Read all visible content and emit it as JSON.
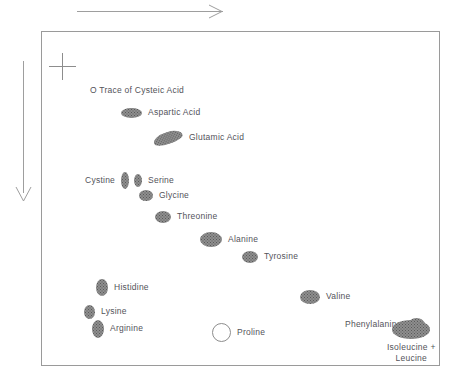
{
  "figure": {
    "background_color": "#ffffff",
    "plate_border_color": "#9a9a9a",
    "spot_color": "#8e8e8e",
    "text_color": "#53535a",
    "arrow_color": "#9e9e9e"
  },
  "arrows": {
    "horizontal": {
      "name": "first-dimension-arrow",
      "direction": "right"
    },
    "vertical": {
      "name": "second-dimension-arrow",
      "direction": "down"
    }
  },
  "origin": {
    "name": "origin-cross-mark",
    "symbol": "+"
  },
  "chart_data": {
    "type": "scatter",
    "xlabel": "",
    "ylabel": "",
    "grid": false,
    "legend": "none",
    "annotations": [
      "O Trace of Cysteic Acid"
    ],
    "spots": [
      {
        "label": "O Trace of Cysteic Acid",
        "name": "spot-cysteic-acid",
        "shape": "trace",
        "x": 90,
        "y": 85,
        "w": 0,
        "h": 0,
        "label_position": "right"
      },
      {
        "label": "Aspartic Acid",
        "name": "spot-aspartic-acid",
        "shape": "ellipse",
        "x": 121,
        "y": 107,
        "w": 21,
        "h": 10,
        "label_position": "right"
      },
      {
        "label": "Glutamic Acid",
        "name": "spot-glutamic-acid",
        "shape": "ellipse-double",
        "x": 153,
        "y": 132,
        "w": 30,
        "h": 12,
        "label_position": "right"
      },
      {
        "label": "Cystine",
        "name": "spot-cystine",
        "shape": "ellipse-vertical",
        "x": 85,
        "y": 172,
        "w": 8,
        "h": 17,
        "label_position": "left"
      },
      {
        "label": "Serine",
        "name": "spot-serine",
        "shape": "ellipse-vertical",
        "x": 134,
        "y": 174,
        "w": 8,
        "h": 13,
        "label_position": "right"
      },
      {
        "label": "Glycine",
        "name": "spot-glycine",
        "shape": "ellipse",
        "x": 139,
        "y": 190,
        "w": 14,
        "h": 11,
        "label_position": "right"
      },
      {
        "label": "Threonine",
        "name": "spot-threonine",
        "shape": "ellipse",
        "x": 155,
        "y": 211,
        "w": 16,
        "h": 12,
        "label_position": "right"
      },
      {
        "label": "Alanine",
        "name": "spot-alanine",
        "shape": "ellipse",
        "x": 200,
        "y": 232,
        "w": 22,
        "h": 15,
        "label_position": "right"
      },
      {
        "label": "Tyrosine",
        "name": "spot-tyrosine",
        "shape": "ellipse",
        "x": 242,
        "y": 251,
        "w": 16,
        "h": 12,
        "label_position": "right"
      },
      {
        "label": "Histidine",
        "name": "spot-histidine",
        "shape": "ellipse-vertical",
        "x": 96,
        "y": 279,
        "w": 12,
        "h": 17,
        "label_position": "right"
      },
      {
        "label": "Lysine",
        "name": "spot-lysine",
        "shape": "ellipse-vertical",
        "x": 84,
        "y": 305,
        "w": 11,
        "h": 14,
        "label_position": "right"
      },
      {
        "label": "Arginine",
        "name": "spot-arginine",
        "shape": "ellipse-vertical",
        "x": 92,
        "y": 320,
        "w": 12,
        "h": 18,
        "label_position": "right"
      },
      {
        "label": "Proline",
        "name": "spot-proline",
        "shape": "hollow-circle",
        "x": 212,
        "y": 323,
        "w": 17,
        "h": 17,
        "label_position": "right"
      },
      {
        "label": "Valine",
        "name": "spot-valine",
        "shape": "ellipse",
        "x": 300,
        "y": 290,
        "w": 20,
        "h": 14,
        "label_position": "right"
      },
      {
        "label": "Phenylalanine",
        "name": "spot-phenylalanine",
        "shape": "ellipse",
        "x": 345,
        "y": 318,
        "w": 17,
        "h": 13,
        "label_position": "left"
      },
      {
        "label": "Isoleucine + Leucine",
        "name": "spot-isoleucine-leucine",
        "shape": "ellipse-large",
        "x": 387,
        "y": 320,
        "w": 38,
        "h": 19,
        "label_position": "below",
        "label_line1": "Isoleucine +",
        "label_line2": "Leucine"
      }
    ]
  }
}
